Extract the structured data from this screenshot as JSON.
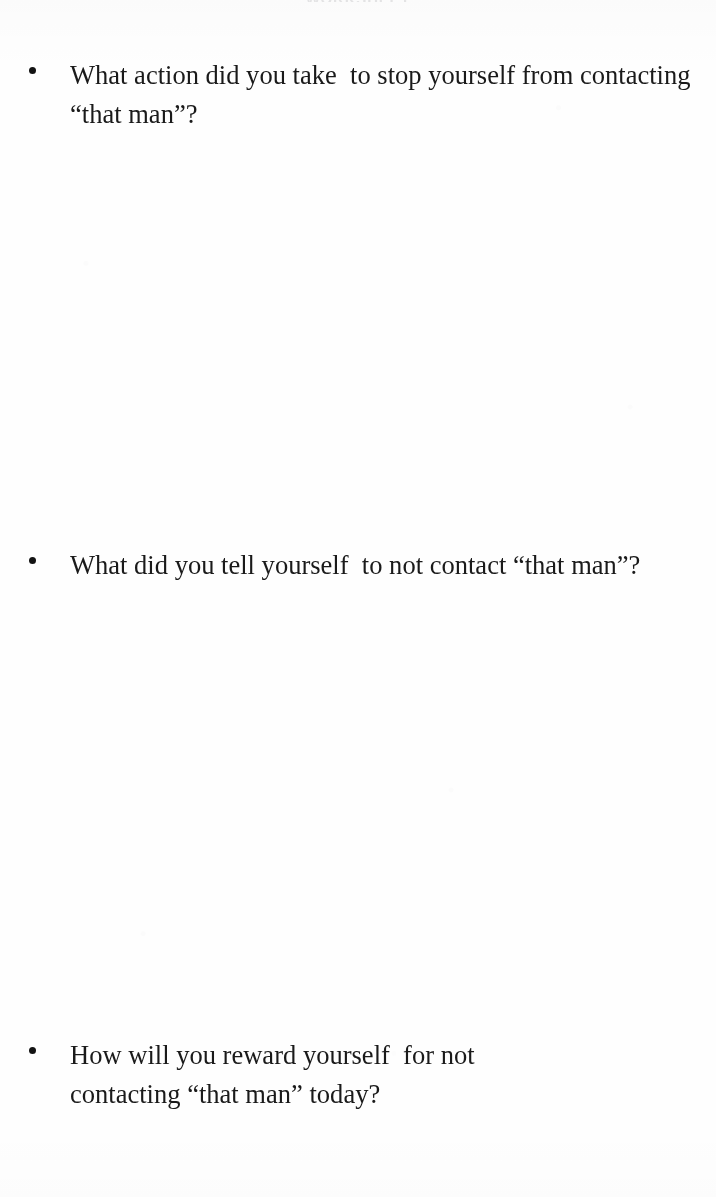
{
  "document": {
    "page_background": "#fefefe",
    "text_color": "#1a1a1a",
    "cropped_heading_text": "WORKSHEET",
    "bullet_glyph": "•"
  },
  "questions": [
    {
      "id": "q1",
      "bullet": "•",
      "text": "What action did you take  to stop yourself from contacting  “that man”?"
    },
    {
      "id": "q2",
      "bullet": "•",
      "text": "What did you tell yourself  to not contact “that man”?"
    },
    {
      "id": "q3",
      "bullet": "•",
      "text": "How will you reward yourself  for not contacting “that man” today?"
    }
  ],
  "answer_spaces": [
    {
      "id": "a1",
      "placeholder": ""
    },
    {
      "id": "a2",
      "placeholder": ""
    },
    {
      "id": "a3",
      "placeholder": ""
    }
  ]
}
